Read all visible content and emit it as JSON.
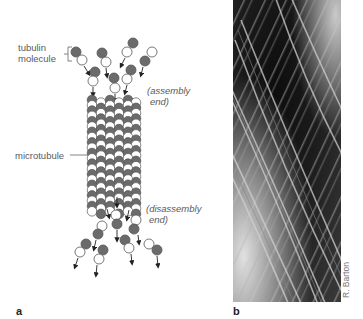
{
  "figure": {
    "panel_a": {
      "label": "a",
      "labels": {
        "tubulin_line1": "tubulin",
        "tubulin_line2": "molecule",
        "microtubule": "microtubule",
        "assembly_line1": "(assembly",
        "assembly_line2": "end)",
        "disassembly_line1": "(disassembly",
        "disassembly_line2": "end)"
      },
      "colors": {
        "dark_subunit": "#6b6b6b",
        "light_subunit": "#ffffff",
        "outline": "#555555",
        "arrow": "#222222"
      }
    },
    "panel_b": {
      "label": "b",
      "credit": "R. Barton",
      "description": "electron micrograph of microtubules"
    }
  }
}
